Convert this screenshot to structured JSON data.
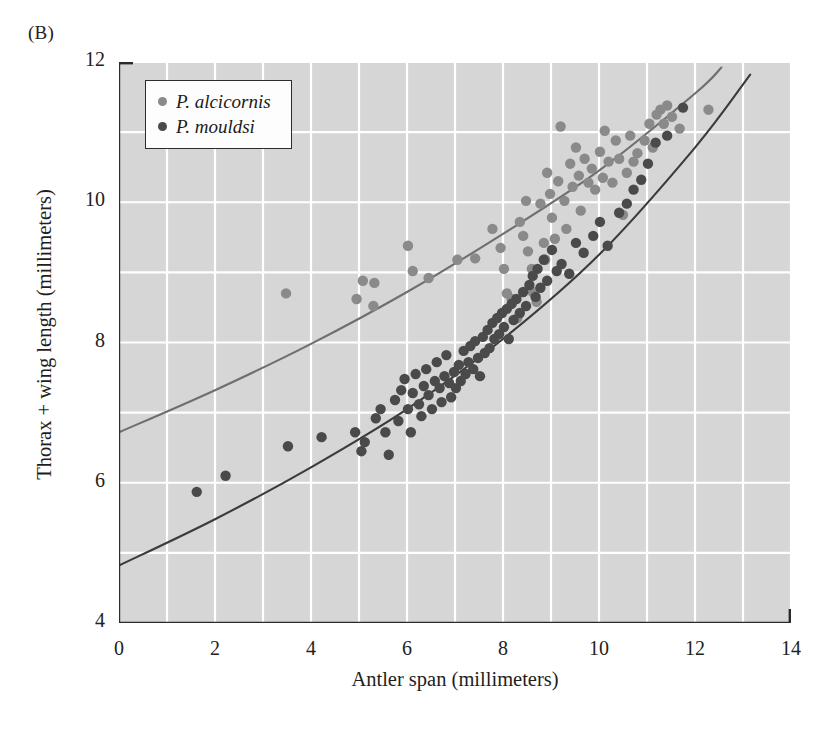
{
  "figure": {
    "panel_label": "(B)"
  },
  "legend": {
    "position": "top-left-inside",
    "entries": [
      {
        "label": "P. alcicornis",
        "color": "#8a8a8a",
        "marker": "legend-dot-alcicornis"
      },
      {
        "label": "P. mouldsi",
        "color": "#4a4a4a",
        "marker": "legend-dot-mouldsi"
      }
    ]
  },
  "style": {
    "plot_background": "#d6d6d6",
    "gridline_color": "#ffffff",
    "axis_color": "#2b2b2b",
    "curve_alcicornis_color": "#6f6f6f",
    "curve_mouldsi_color": "#3b3b3b"
  },
  "chart_data": {
    "type": "scatter",
    "title": "",
    "xlabel": "Antler span (millimeters)",
    "ylabel": "Thorax + wing length (millimeters)",
    "xlim": [
      0,
      14
    ],
    "ylim": [
      4,
      12
    ],
    "xticks": [
      0,
      2,
      4,
      6,
      8,
      10,
      12,
      14
    ],
    "yticks": [
      4,
      6,
      8,
      10,
      12
    ],
    "x_minor_step": 1,
    "y_minor_step": 1,
    "grid": true,
    "grid_step_x": 1,
    "grid_step_y": 1,
    "series": [
      {
        "name": "P. alcicornis",
        "color": "#8a8a8a",
        "marker": "circle",
        "points": [
          [
            3.48,
            8.7
          ],
          [
            4.95,
            8.62
          ],
          [
            5.08,
            8.88
          ],
          [
            5.32,
            8.85
          ],
          [
            5.3,
            8.52
          ],
          [
            6.02,
            9.38
          ],
          [
            6.12,
            9.02
          ],
          [
            6.45,
            8.92
          ],
          [
            7.05,
            9.18
          ],
          [
            7.42,
            9.2
          ],
          [
            7.78,
            9.62
          ],
          [
            7.95,
            9.35
          ],
          [
            8.02,
            9.05
          ],
          [
            8.08,
            8.7
          ],
          [
            8.18,
            8.62
          ],
          [
            8.3,
            8.35
          ],
          [
            8.35,
            9.72
          ],
          [
            8.42,
            9.52
          ],
          [
            8.48,
            10.02
          ],
          [
            8.52,
            9.3
          ],
          [
            8.6,
            9.05
          ],
          [
            8.62,
            8.72
          ],
          [
            8.7,
            8.58
          ],
          [
            8.78,
            9.98
          ],
          [
            8.85,
            9.42
          ],
          [
            8.88,
            9.18
          ],
          [
            8.92,
            10.42
          ],
          [
            8.98,
            10.12
          ],
          [
            9.02,
            9.78
          ],
          [
            9.08,
            9.48
          ],
          [
            9.15,
            10.3
          ],
          [
            9.2,
            11.08
          ],
          [
            9.28,
            10.02
          ],
          [
            9.32,
            9.62
          ],
          [
            9.4,
            10.55
          ],
          [
            9.45,
            10.22
          ],
          [
            9.52,
            10.78
          ],
          [
            9.58,
            10.38
          ],
          [
            9.62,
            9.88
          ],
          [
            9.7,
            10.62
          ],
          [
            9.78,
            10.28
          ],
          [
            9.85,
            10.48
          ],
          [
            9.92,
            10.18
          ],
          [
            10.02,
            10.72
          ],
          [
            10.08,
            10.35
          ],
          [
            10.12,
            11.02
          ],
          [
            10.2,
            10.58
          ],
          [
            10.28,
            10.28
          ],
          [
            10.35,
            10.88
          ],
          [
            10.42,
            10.62
          ],
          [
            10.5,
            9.82
          ],
          [
            10.58,
            10.42
          ],
          [
            10.65,
            10.95
          ],
          [
            10.72,
            10.58
          ],
          [
            10.8,
            10.7
          ],
          [
            10.95,
            10.88
          ],
          [
            11.05,
            11.12
          ],
          [
            11.12,
            10.78
          ],
          [
            11.2,
            11.25
          ],
          [
            11.28,
            11.32
          ],
          [
            11.35,
            11.12
          ],
          [
            11.42,
            11.38
          ],
          [
            11.52,
            11.22
          ],
          [
            11.68,
            11.05
          ],
          [
            12.28,
            11.32
          ]
        ]
      },
      {
        "name": "P. mouldsi",
        "color": "#4a4a4a",
        "marker": "circle",
        "points": [
          [
            1.62,
            5.87
          ],
          [
            2.22,
            6.1
          ],
          [
            3.52,
            6.52
          ],
          [
            4.22,
            6.65
          ],
          [
            4.92,
            6.72
          ],
          [
            5.05,
            6.45
          ],
          [
            5.12,
            6.58
          ],
          [
            5.35,
            6.92
          ],
          [
            5.45,
            7.05
          ],
          [
            5.55,
            6.72
          ],
          [
            5.62,
            6.4
          ],
          [
            5.75,
            7.18
          ],
          [
            5.82,
            6.88
          ],
          [
            5.88,
            7.32
          ],
          [
            5.95,
            7.48
          ],
          [
            6.02,
            7.05
          ],
          [
            6.08,
            6.72
          ],
          [
            6.12,
            7.28
          ],
          [
            6.18,
            7.55
          ],
          [
            6.25,
            7.12
          ],
          [
            6.3,
            6.95
          ],
          [
            6.35,
            7.38
          ],
          [
            6.4,
            7.62
          ],
          [
            6.45,
            7.25
          ],
          [
            6.52,
            7.05
          ],
          [
            6.58,
            7.45
          ],
          [
            6.62,
            7.72
          ],
          [
            6.68,
            7.35
          ],
          [
            6.72,
            7.15
          ],
          [
            6.78,
            7.52
          ],
          [
            6.82,
            7.82
          ],
          [
            6.88,
            7.42
          ],
          [
            6.92,
            7.22
          ],
          [
            6.98,
            7.58
          ],
          [
            7.02,
            7.35
          ],
          [
            7.08,
            7.68
          ],
          [
            7.12,
            7.45
          ],
          [
            7.18,
            7.88
          ],
          [
            7.22,
            7.55
          ],
          [
            7.28,
            7.72
          ],
          [
            7.32,
            7.95
          ],
          [
            7.38,
            7.62
          ],
          [
            7.42,
            8.02
          ],
          [
            7.48,
            7.78
          ],
          [
            7.52,
            7.52
          ],
          [
            7.58,
            8.08
          ],
          [
            7.62,
            7.85
          ],
          [
            7.68,
            8.18
          ],
          [
            7.72,
            7.92
          ],
          [
            7.78,
            8.28
          ],
          [
            7.82,
            8.05
          ],
          [
            7.88,
            8.35
          ],
          [
            7.92,
            8.12
          ],
          [
            7.98,
            8.42
          ],
          [
            8.02,
            8.22
          ],
          [
            8.08,
            8.48
          ],
          [
            8.12,
            8.05
          ],
          [
            8.18,
            8.55
          ],
          [
            8.22,
            8.32
          ],
          [
            8.28,
            8.62
          ],
          [
            8.35,
            8.42
          ],
          [
            8.42,
            8.72
          ],
          [
            8.48,
            8.52
          ],
          [
            8.55,
            8.82
          ],
          [
            8.62,
            8.95
          ],
          [
            8.68,
            8.65
          ],
          [
            8.72,
            9.05
          ],
          [
            8.78,
            8.78
          ],
          [
            8.85,
            9.18
          ],
          [
            8.92,
            8.88
          ],
          [
            9.02,
            9.32
          ],
          [
            9.12,
            9.02
          ],
          [
            9.22,
            9.12
          ],
          [
            9.38,
            8.98
          ],
          [
            9.52,
            9.42
          ],
          [
            9.68,
            9.28
          ],
          [
            9.88,
            9.52
          ],
          [
            10.02,
            9.72
          ],
          [
            10.18,
            9.38
          ],
          [
            10.42,
            9.85
          ],
          [
            10.58,
            9.98
          ],
          [
            10.72,
            10.18
          ],
          [
            10.88,
            10.32
          ],
          [
            11.02,
            10.55
          ],
          [
            11.18,
            10.85
          ],
          [
            11.42,
            10.95
          ],
          [
            11.75,
            11.35
          ]
        ]
      }
    ],
    "fitted_curves": [
      {
        "name": "P. alcicornis fit",
        "color": "#6f6f6f",
        "x_start": 0.0,
        "x_end": 12.55,
        "control_points": [
          [
            0.0,
            6.72
          ],
          [
            2.0,
            7.32
          ],
          [
            4.0,
            7.98
          ],
          [
            6.0,
            8.72
          ],
          [
            8.0,
            9.55
          ],
          [
            10.0,
            10.45
          ],
          [
            12.0,
            11.55
          ],
          [
            12.55,
            11.92
          ]
        ]
      },
      {
        "name": "P. mouldsi fit",
        "color": "#3b3b3b",
        "x_start": 0.0,
        "x_end": 13.15,
        "control_points": [
          [
            0.0,
            4.82
          ],
          [
            2.0,
            5.48
          ],
          [
            4.0,
            6.22
          ],
          [
            6.0,
            7.05
          ],
          [
            8.0,
            8.05
          ],
          [
            10.0,
            9.25
          ],
          [
            12.0,
            10.78
          ],
          [
            13.15,
            11.82
          ]
        ]
      }
    ]
  }
}
